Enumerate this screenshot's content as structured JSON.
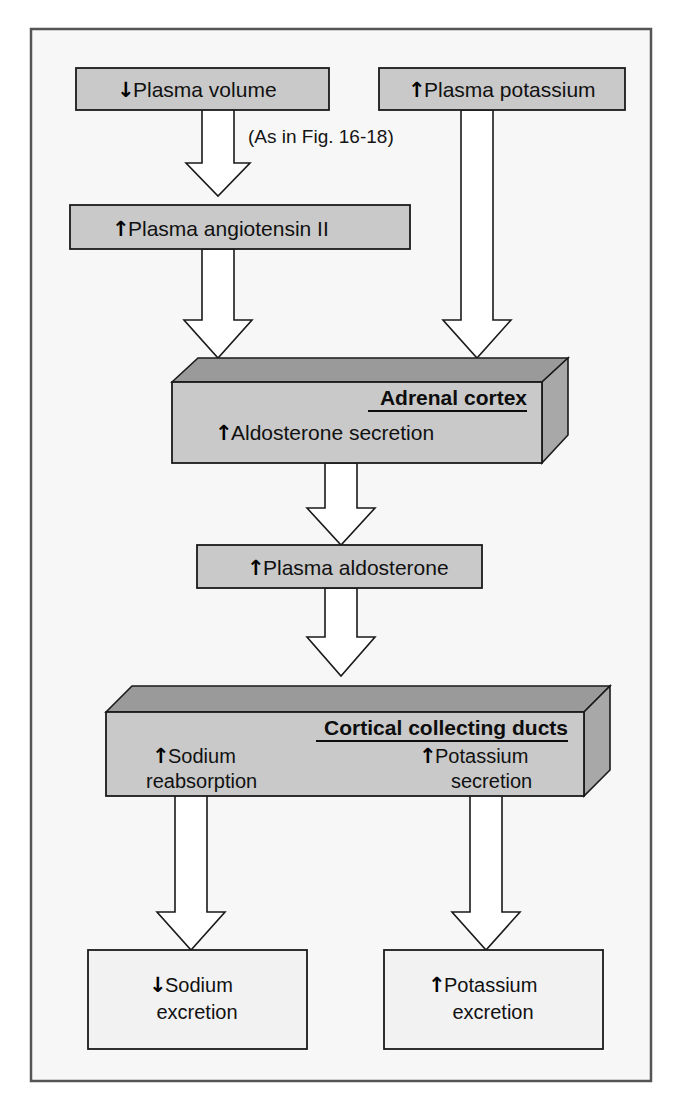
{
  "figure": {
    "background_color": "#f7f7f7",
    "frame_color": "#555555",
    "box_fill_gray": "#c9c9c9",
    "box_fill_light": "#f2f2f2",
    "box_stroke": "#1a1a1a",
    "arrow_fill": "#ffffff",
    "arrow_stroke": "#1a1a1a",
    "top_face_fill": "#9a9a9a",
    "side_face_fill": "#a8a8a8",
    "note": "(As in Fig. 16-18)"
  },
  "nodes": {
    "plasma_volume": {
      "direction": "↓",
      "label": "Plasma volume"
    },
    "plasma_potassium": {
      "direction": "↑",
      "label": "Plasma potassium"
    },
    "plasma_angiotensin": {
      "direction": "↑",
      "label": "Plasma angiotensin II"
    },
    "adrenal_cortex": {
      "title": "Adrenal cortex",
      "direction": "↑",
      "label": "Aldosterone secretion"
    },
    "plasma_aldosterone": {
      "direction": "↑",
      "label": "Plasma aldosterone"
    },
    "collecting_ducts": {
      "title": "Cortical collecting ducts",
      "sodium": {
        "direction": "↑",
        "line1": "Sodium",
        "line2": "reabsorption"
      },
      "potassium": {
        "direction": "↑",
        "line1": "Potassium",
        "line2": "secretion"
      }
    },
    "sodium_excretion": {
      "direction": "↓",
      "line1": "Sodium",
      "line2": "excretion"
    },
    "potassium_excretion": {
      "direction": "↑",
      "line1": "Potassium",
      "line2": "excretion"
    }
  }
}
